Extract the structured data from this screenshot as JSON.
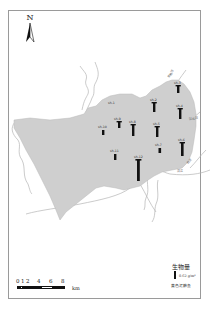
{
  "map": {
    "north_arrow": {
      "label": "N",
      "icon": "north-arrow-icon"
    },
    "colors": {
      "study_area_fill": "#cfcfcf",
      "river_stroke": "#b5b5b5",
      "bar_fill": "#111111",
      "frame_border": "#9a9a9a"
    },
    "stations": [
      {
        "id": "s1",
        "label": "sh-1",
        "x": 112,
        "y": 104,
        "bar_height": 0,
        "show_label_only": true
      },
      {
        "id": "s2",
        "label": "sh-2",
        "x": 154,
        "y": 106,
        "bar_height": 10
      },
      {
        "id": "s3",
        "label": "sh-3",
        "x": 178,
        "y": 88,
        "bar_height": 8
      },
      {
        "id": "s4",
        "label": "sh-4",
        "x": 180,
        "y": 112,
        "bar_height": 11
      },
      {
        "id": "s5",
        "label": "sh-5",
        "x": 157,
        "y": 130,
        "bar_height": 11
      },
      {
        "id": "s6",
        "label": "sh-6",
        "x": 182,
        "y": 146,
        "bar_height": 14
      },
      {
        "id": "s7",
        "label": "sh-7",
        "x": 160,
        "y": 150,
        "bar_height": 5
      },
      {
        "id": "s8",
        "label": "sh-8",
        "x": 133,
        "y": 127,
        "bar_height": 12
      },
      {
        "id": "s9",
        "label": "sh-9",
        "x": 119,
        "y": 123,
        "bar_height": 7
      },
      {
        "id": "s10",
        "label": "sh-10",
        "x": 103,
        "y": 130,
        "bar_height": 5
      },
      {
        "id": "s11",
        "label": "sh-11",
        "x": 115,
        "y": 155,
        "bar_height": 6
      },
      {
        "id": "s12",
        "label": "sh-12",
        "x": 138,
        "y": 163,
        "bar_height": 22
      }
    ],
    "river_labels": [
      {
        "text": "东荆河",
        "x": 169,
        "y": 78,
        "rotate": -55
      },
      {
        "text": "汉北河",
        "x": 189,
        "y": 120,
        "rotate": -5
      },
      {
        "text": "府河",
        "x": 188,
        "y": 164,
        "rotate": -50
      },
      {
        "text": "汉江",
        "x": 177,
        "y": 172,
        "rotate": 0
      }
    ]
  },
  "scale_bar": {
    "ticks": [
      "0",
      "1",
      "2",
      "4",
      "6",
      "8"
    ],
    "unit": "km"
  },
  "legend": {
    "title": "生物量",
    "value": "0.62 g/m²",
    "species": "黄色泥鳅鱼"
  }
}
